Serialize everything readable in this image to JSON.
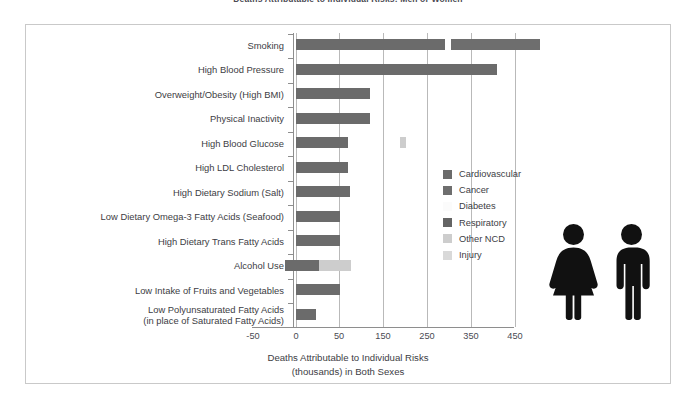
{
  "figure": {
    "title": "Deaths Attributable to Individual Risks: Men or Women",
    "xaxis_title_line1": "Deaths Attributable to Individual Risks",
    "xaxis_title_line2": "(thousands) in Both Sexes"
  },
  "legend": {
    "items": [
      {
        "label": "Cardiovascular",
        "color": "#6b6b6b"
      },
      {
        "label": "Cancer",
        "color": "#6e6e6e"
      },
      {
        "label": "Diabetes",
        "color": "#fbfbfb"
      },
      {
        "label": "Respiratory",
        "color": "#646464"
      },
      {
        "label": "Other NCD",
        "color": "#cdcdcd"
      },
      {
        "label": "Injury",
        "color": "#d9d9d9"
      }
    ]
  },
  "axes": {
    "xticks": [
      "-50",
      "0",
      "50",
      "150",
      "250",
      "350",
      "450"
    ],
    "xtick_values": [
      -50,
      0,
      50,
      150,
      250,
      350,
      450
    ],
    "xlim": [
      -50,
      500
    ]
  },
  "pictograms": [
    {
      "name": "female-figure",
      "color": "#111111"
    },
    {
      "name": "male-figure",
      "color": "#111111"
    }
  ],
  "chart_data": {
    "type": "bar",
    "orientation": "horizontal",
    "stacked": true,
    "title": "Deaths Attributable to Individual Risks: Men or Women",
    "xlabel": "Deaths Attributable to Individual Risks (thousands) in Both Sexes",
    "ylabel": "",
    "xlim": [
      -50,
      500
    ],
    "grid": true,
    "legend_position": "center-right",
    "categories": [
      "Smoking",
      "High Blood Pressure",
      "Overweight/Obesity (High BMI)",
      "Physical Inactivity",
      "High Blood Glucose",
      "High LDL Cholesterol",
      "High Dietary Sodium (Salt)",
      "Low Dietary Omega-3 Fatty Acids (Seafood)",
      "High Dietary Trans Fatty Acids",
      "Alcohol Use",
      "Low Intake of Fruits and Vegetables",
      "Low Polyunsaturated Fatty Acids (in place of Saturated Fatty Acids)"
    ],
    "series": [
      {
        "name": "Cardiovascular",
        "color": "#6b6b6b",
        "values": [
          130,
          395,
          170,
          170,
          115,
          115,
          120,
          100,
          100,
          55,
          100,
          45
        ]
      },
      {
        "name": "Cancer",
        "color": "#6e6e6e",
        "values": [
          210,
          0,
          0,
          0,
          0,
          0,
          0,
          0,
          0,
          0,
          0,
          0
        ]
      },
      {
        "name": "Diabetes",
        "color": "#fbfbfb",
        "values": [
          0,
          0,
          0,
          0,
          0,
          0,
          0,
          0,
          0,
          0,
          0,
          0
        ]
      },
      {
        "name": "Respiratory",
        "color": "#646464",
        "values": [
          125,
          0,
          0,
          0,
          0,
          0,
          0,
          0,
          0,
          0,
          0,
          0
        ]
      },
      {
        "name": "Other NCD",
        "color": "#cdcdcd",
        "values": [
          0,
          0,
          0,
          0,
          15,
          0,
          0,
          0,
          0,
          75,
          0,
          0
        ]
      },
      {
        "name": "Injury",
        "color": "#d9d9d9",
        "values": [
          0,
          0,
          0,
          0,
          0,
          0,
          0,
          0,
          0,
          0,
          0,
          0
        ]
      }
    ],
    "totals": [
      465,
      395,
      170,
      170,
      130,
      115,
      120,
      100,
      100,
      130,
      100,
      45
    ],
    "negative_values": {
      "Alcohol Use": -25
    }
  },
  "bars": [
    {
      "name": "Smoking",
      "segments": [
        {
          "series": "Cardiovascular",
          "left": 296,
          "width": 149,
          "color": "#6b6b6b"
        },
        {
          "series": "Cancer",
          "left": 451,
          "width": 89,
          "color": "#6e6e6e"
        }
      ]
    },
    {
      "name": "High Blood Pressure",
      "segments": [
        {
          "series": "Cardiovascular",
          "left": 296,
          "width": 201,
          "color": "#6b6b6b"
        }
      ]
    },
    {
      "name": "Overweight/Obesity (High BMI)",
      "segments": [
        {
          "series": "Cardiovascular",
          "left": 296,
          "width": 74,
          "color": "#6b6b6b"
        }
      ]
    },
    {
      "name": "Physical Inactivity",
      "segments": [
        {
          "series": "Cardiovascular",
          "left": 296,
          "width": 74,
          "color": "#6b6b6b"
        }
      ]
    },
    {
      "name": "High Blood Glucose",
      "segments": [
        {
          "series": "Cardiovascular",
          "left": 296,
          "width": 52,
          "color": "#6b6b6b"
        },
        {
          "series": "Other NCD",
          "left": 400,
          "width": 6,
          "color": "#cdcdcd"
        }
      ]
    },
    {
      "name": "High LDL Cholesterol",
      "segments": [
        {
          "series": "Cardiovascular",
          "left": 296,
          "width": 52,
          "color": "#6b6b6b"
        }
      ]
    },
    {
      "name": "High Dietary Sodium (Salt)",
      "segments": [
        {
          "series": "Cardiovascular",
          "left": 296,
          "width": 54,
          "color": "#6b6b6b"
        }
      ]
    },
    {
      "name": "Low Dietary Omega-3 Fatty Acids (Seafood)",
      "segments": [
        {
          "series": "Cardiovascular",
          "left": 296,
          "width": 44,
          "color": "#6b6b6b"
        }
      ]
    },
    {
      "name": "High Dietary Trans Fatty Acids",
      "segments": [
        {
          "series": "Cardiovascular",
          "left": 296,
          "width": 44,
          "color": "#6b6b6b"
        }
      ]
    },
    {
      "name": "Alcohol Use",
      "segments": [
        {
          "series": "Cardiovascular",
          "left": 285,
          "width": 34,
          "color": "#6b6b6b"
        },
        {
          "series": "Other NCD",
          "left": 319,
          "width": 32,
          "color": "#cdcdcd"
        }
      ]
    },
    {
      "name": "Low Intake of Fruits and Vegetables",
      "segments": [
        {
          "series": "Cardiovascular",
          "left": 296,
          "width": 44,
          "color": "#6b6b6b"
        }
      ]
    },
    {
      "name": "Low Polyunsaturated Fatty Acids (in place of Saturated Fatty Acids)",
      "segments": [
        {
          "series": "Cardiovascular",
          "left": 296,
          "width": 20,
          "color": "#6b6b6b"
        }
      ]
    }
  ],
  "ylabels": [
    {
      "text": "Smoking",
      "lines": [
        "Smoking"
      ]
    },
    {
      "text": "High Blood Pressure",
      "lines": [
        "High Blood Pressure"
      ]
    },
    {
      "text": "Overweight/Obesity (High BMI)",
      "lines": [
        "Overweight/Obesity (High BMI)"
      ]
    },
    {
      "text": "Physical Inactivity",
      "lines": [
        "Physical Inactivity"
      ]
    },
    {
      "text": "High Blood Glucose",
      "lines": [
        "High Blood Glucose"
      ]
    },
    {
      "text": "High LDL Cholesterol",
      "lines": [
        "High LDL Cholesterol"
      ]
    },
    {
      "text": "High Dietary Sodium (Salt)",
      "lines": [
        "High Dietary Sodium (Salt)"
      ]
    },
    {
      "text": "Low Dietary Omega-3 Fatty Acids (Seafood)",
      "lines": [
        "Low Dietary Omega-3 Fatty Acids (Seafood)"
      ]
    },
    {
      "text": "High Dietary Trans Fatty Acids",
      "lines": [
        "High Dietary Trans Fatty Acids"
      ]
    },
    {
      "text": "Alcohol Use",
      "lines": [
        "Alcohol Use"
      ]
    },
    {
      "text": "Low Intake of Fruits and Vegetables",
      "lines": [
        "Low Intake of Fruits and Vegetables"
      ]
    },
    {
      "text": "Low Polyunsaturated Fatty Acids (in place of Saturated Fatty Acids)",
      "lines": [
        "Low Polyunsaturated Fatty Acids",
        "(in place of Saturated Fatty Acids)"
      ]
    }
  ]
}
